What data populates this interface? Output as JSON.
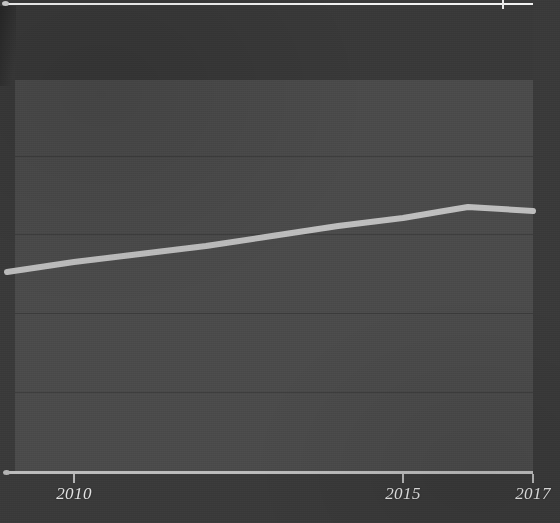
{
  "chart_data": {
    "type": "line",
    "title": "",
    "subtitle": "",
    "xlabel": "",
    "ylabel": "",
    "grid": true,
    "legend_position": "none",
    "xlim": [
      2008.7,
      2017.0
    ],
    "ylim": [
      0,
      5
    ],
    "x_ticks": [
      {
        "label": "2010",
        "value": 2010,
        "px": 74
      },
      {
        "label": "2015",
        "value": 2015,
        "px": 403
      },
      {
        "label": "2017",
        "value": 2017,
        "px": 533
      }
    ],
    "y_gridlines_px": [
      156,
      234,
      313,
      392
    ],
    "series": [
      {
        "name": "series-1",
        "color": "#c8c8c8",
        "x": [
          2008.7,
          2010.0,
          2011.0,
          2012.0,
          2013.0,
          2014.0,
          2015.0,
          2015.9,
          2016.4,
          2017.0
        ],
        "y": [
          2.55,
          2.78,
          2.92,
          3.05,
          3.22,
          3.42,
          3.62,
          3.78,
          3.83,
          3.8
        ],
        "points_px": [
          {
            "x": 7,
            "y": 272
          },
          {
            "x": 74,
            "y": 262
          },
          {
            "x": 140,
            "y": 254
          },
          {
            "x": 206,
            "y": 246
          },
          {
            "x": 272,
            "y": 236
          },
          {
            "x": 338,
            "y": 226
          },
          {
            "x": 403,
            "y": 218
          },
          {
            "x": 444,
            "y": 211
          },
          {
            "x": 468,
            "y": 207
          },
          {
            "x": 533,
            "y": 211
          }
        ]
      }
    ]
  },
  "axes": {
    "x_axis_color": "#bdbdbd",
    "gridline_color": "#3c3c3c",
    "tick_label_color": "#e2e2e2",
    "plot_background": "#4b4b4b",
    "figure_background": "#3a3a3a"
  },
  "cropped_chart_above": {
    "axis_color": "#f2f2f2",
    "tick_px": 503
  }
}
